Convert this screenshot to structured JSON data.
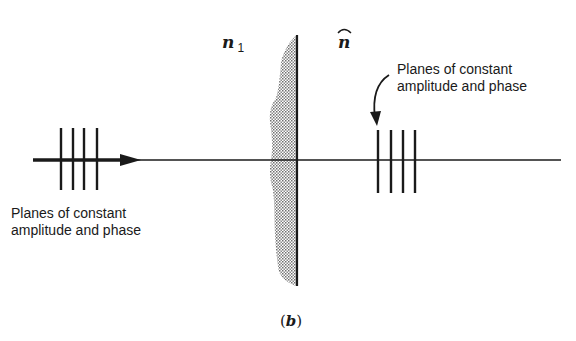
{
  "figure": {
    "caption": "(b)",
    "caption_letter": "b",
    "medium_label": {
      "symbol": "n",
      "subscript": "1"
    },
    "normal_label": {
      "symbol": "n",
      "accent": "hat"
    },
    "left_annotation": {
      "line1": "Planes of constant",
      "line2": "amplitude and phase"
    },
    "right_annotation": {
      "line1": "Planes of constant",
      "line2": "amplitude and phase"
    },
    "incident_planes_count": 4,
    "transmitted_planes_count": 4,
    "colors": {
      "ink": "#1a1a1a",
      "shading": "#9a9a9a",
      "background": "#ffffff"
    }
  }
}
